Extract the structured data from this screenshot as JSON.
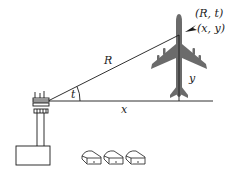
{
  "diagram": {
    "type": "polar-rectangular-coordinates",
    "labels": {
      "polar_point": "(R, t)",
      "rect_point": "(x, y)",
      "radius": "R",
      "angle": "t",
      "horizontal": "x",
      "vertical": "y"
    },
    "colors": {
      "line": "#1a1a1a",
      "airplane": "#6b6b6b",
      "text": "#222222"
    },
    "objects": [
      "control-tower",
      "airplane",
      "hangars"
    ]
  }
}
